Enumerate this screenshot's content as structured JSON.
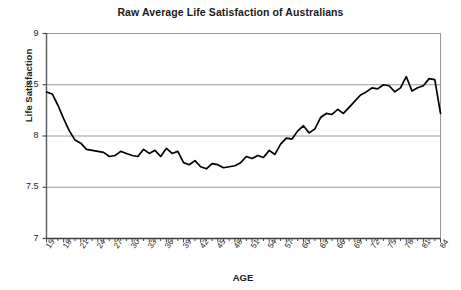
{
  "chart_data": {
    "type": "line",
    "title": "Raw Average Life Satisfaction of Australians",
    "xlabel": "AGE",
    "ylabel": "Life Satisfaction",
    "xlim": [
      15,
      84
    ],
    "ylim": [
      7,
      9
    ],
    "yticks": [
      "7",
      "7.5",
      "8",
      "8.5",
      "9"
    ],
    "ytick_values": [
      7,
      7.5,
      8,
      8.5,
      9
    ],
    "xticks": [
      "15",
      "18",
      "21",
      "24",
      "27",
      "30",
      "33",
      "36",
      "39",
      "42",
      "45",
      "48",
      "51",
      "54",
      "57",
      "60",
      "63",
      "66",
      "69",
      "72",
      "75",
      "78",
      "81",
      "84"
    ],
    "xtick_values": [
      15,
      18,
      21,
      24,
      27,
      30,
      33,
      36,
      39,
      42,
      45,
      48,
      51,
      54,
      57,
      60,
      63,
      66,
      69,
      72,
      75,
      78,
      81,
      84
    ],
    "grid": "horizontal",
    "legend_position": "none",
    "line_color": "#000000",
    "grid_color": "#9a9a9a",
    "axis_color": "#7d7d7d",
    "series": [
      {
        "name": "Raw average life satisfaction",
        "x": [
          15,
          16,
          17,
          18,
          19,
          20,
          21,
          22,
          23,
          24,
          25,
          26,
          27,
          28,
          29,
          30,
          31,
          32,
          33,
          34,
          35,
          36,
          37,
          38,
          39,
          40,
          41,
          42,
          43,
          44,
          45,
          46,
          47,
          48,
          49,
          50,
          51,
          52,
          53,
          54,
          55,
          56,
          57,
          58,
          59,
          60,
          61,
          62,
          63,
          64,
          65,
          66,
          67,
          68,
          69,
          70,
          71,
          72,
          73,
          74,
          75,
          76,
          77,
          78,
          79,
          80,
          81,
          82,
          83,
          84
        ],
        "values": [
          8.43,
          8.41,
          8.3,
          8.17,
          8.05,
          7.96,
          7.93,
          7.87,
          7.86,
          7.85,
          7.84,
          7.8,
          7.81,
          7.85,
          7.83,
          7.81,
          7.8,
          7.87,
          7.83,
          7.86,
          7.8,
          7.88,
          7.83,
          7.85,
          7.74,
          7.72,
          7.76,
          7.7,
          7.68,
          7.73,
          7.72,
          7.69,
          7.7,
          7.71,
          7.74,
          7.8,
          7.78,
          7.81,
          7.79,
          7.86,
          7.82,
          7.92,
          7.98,
          7.97,
          8.05,
          8.1,
          8.03,
          8.07,
          8.18,
          8.22,
          8.21,
          8.26,
          8.22,
          8.28,
          8.34,
          8.4,
          8.43,
          8.47,
          8.46,
          8.5,
          8.49,
          8.43,
          8.47,
          8.58,
          8.44,
          8.47,
          8.49,
          8.56,
          8.55,
          8.22
        ]
      }
    ]
  }
}
